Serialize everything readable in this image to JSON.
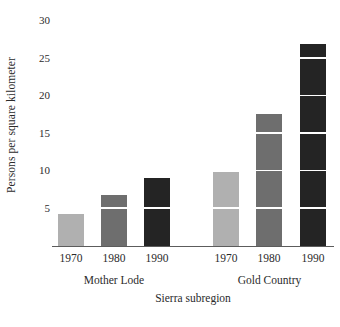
{
  "chart_data": {
    "type": "bar",
    "title": "",
    "subtitle": "",
    "xlabel": "Sierra subregion",
    "ylabel": "Persons per square kilometer",
    "ylim": [
      0,
      30
    ],
    "ytick_values": [
      5,
      10,
      15,
      20,
      25,
      30
    ],
    "ytick_labels": [
      "5",
      "10",
      "15",
      "20",
      "25",
      "30"
    ],
    "grid": false,
    "legend": "none",
    "segment_gridline_interval": 5,
    "groups": [
      {
        "name": "Mother Lode",
        "categories": [
          "1970",
          "1980",
          "1990"
        ],
        "values": [
          4.3,
          6.8,
          9.1
        ],
        "colors": [
          "#b0b0b0",
          "#6e6e6e",
          "#242424"
        ]
      },
      {
        "name": "Gold Country",
        "categories": [
          "1970",
          "1980",
          "1990"
        ],
        "values": [
          9.9,
          17.6,
          26.9
        ],
        "colors": [
          "#b0b0b0",
          "#6e6e6e",
          "#242424"
        ]
      }
    ],
    "categories": [
      "1970",
      "1980",
      "1990",
      "1970",
      "1980",
      "1990"
    ],
    "values": [
      4.3,
      6.8,
      9.1,
      9.9,
      17.6,
      26.9
    ],
    "colors": {
      "year_1970": "#b0b0b0",
      "year_1980": "#6e6e6e",
      "year_1990": "#242424",
      "axis": "#5c5c5c",
      "text": "#2b2b2b",
      "background": "#ffffff",
      "segment_line": "#ffffff"
    }
  },
  "caption": {
    "text": ""
  }
}
